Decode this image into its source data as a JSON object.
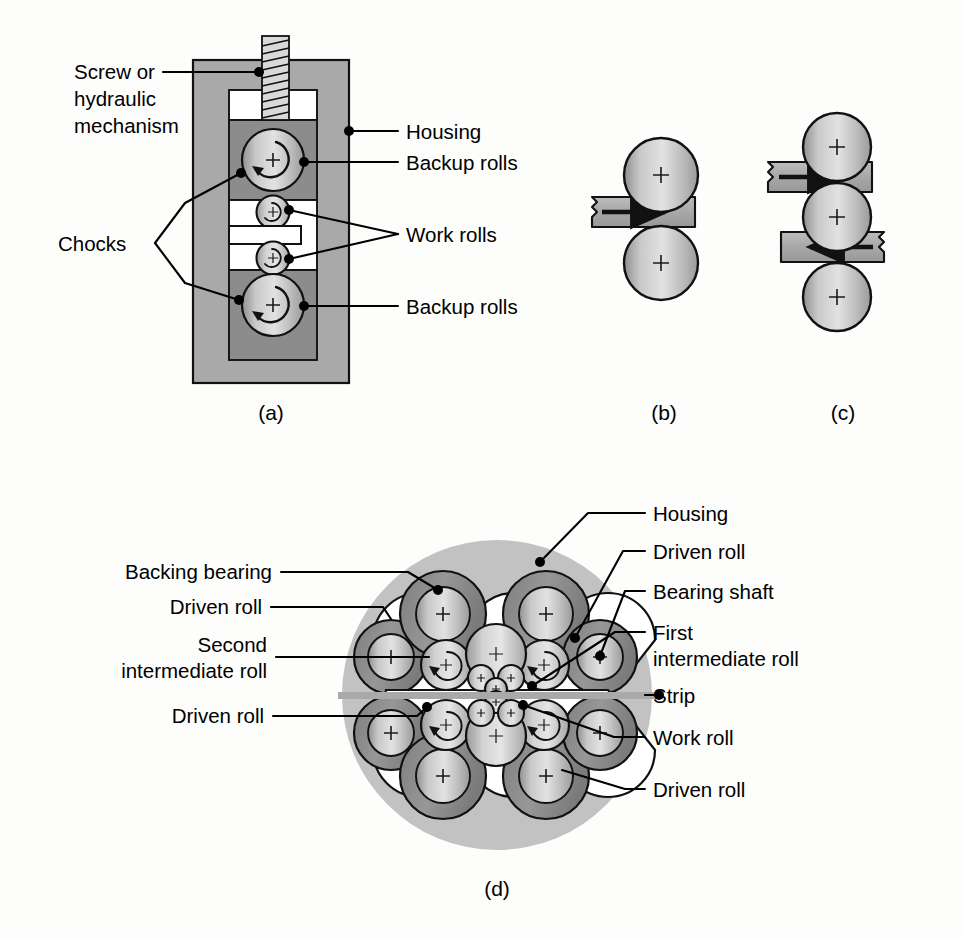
{
  "figure": {
    "background_color": "#fdfdfc",
    "line_color": "#111111",
    "text_color": "#000000",
    "housing_outer_color": "#a9a9a9",
    "housing_inner_color": "#8c8c8c",
    "roll_light_color": "#d6d6d6",
    "roll_mid_color": "#b4b4b4",
    "bearing_ring_color": "#8f8f8f",
    "strip_color": "#b0b0b0",
    "cluster_disc_color": "#c2c2c2"
  },
  "panels": [
    {
      "id": "a",
      "caption": "(a)",
      "name": "four-high-rolling-mill",
      "labels": [
        {
          "id": "screw",
          "text_lines": [
            "Screw or",
            "hydraulic",
            "mechanism"
          ],
          "side": "left"
        },
        {
          "id": "chocks",
          "text_lines": [
            "Chocks"
          ],
          "side": "left"
        },
        {
          "id": "housing",
          "text_lines": [
            "Housing"
          ],
          "side": "right"
        },
        {
          "id": "backup-rolls-top",
          "text_lines": [
            "Backup rolls"
          ],
          "side": "right"
        },
        {
          "id": "work-rolls",
          "text_lines": [
            "Work rolls"
          ],
          "side": "right"
        },
        {
          "id": "backup-rolls-bottom",
          "text_lines": [
            "Backup rolls"
          ],
          "side": "right"
        }
      ]
    },
    {
      "id": "b",
      "caption": "(b)",
      "name": "two-high-rolling-mill",
      "labels": []
    },
    {
      "id": "c",
      "caption": "(c)",
      "name": "three-high-reversing-mill",
      "labels": []
    },
    {
      "id": "d",
      "caption": "(d)",
      "name": "cluster-sendzimir-mill",
      "labels": [
        {
          "id": "backing-bearing",
          "text_lines": [
            "Backing bearing"
          ],
          "side": "left"
        },
        {
          "id": "driven-roll-upper-left",
          "text_lines": [
            "Driven roll"
          ],
          "side": "left"
        },
        {
          "id": "second-intermediate-roll",
          "text_lines": [
            "Second",
            "intermediate roll"
          ],
          "side": "left"
        },
        {
          "id": "driven-roll-lower-left",
          "text_lines": [
            "Driven roll"
          ],
          "side": "left"
        },
        {
          "id": "housing",
          "text_lines": [
            "Housing"
          ],
          "side": "right"
        },
        {
          "id": "driven-roll-upper-right",
          "text_lines": [
            "Driven roll"
          ],
          "side": "right"
        },
        {
          "id": "bearing-shaft",
          "text_lines": [
            "Bearing shaft"
          ],
          "side": "right"
        },
        {
          "id": "first-intermediate-roll",
          "text_lines": [
            "First",
            "intermediate roll"
          ],
          "side": "right"
        },
        {
          "id": "strip",
          "text_lines": [
            "Strip"
          ],
          "side": "right"
        },
        {
          "id": "work-roll",
          "text_lines": [
            "Work roll"
          ],
          "side": "right"
        },
        {
          "id": "driven-roll-lower-right",
          "text_lines": [
            "Driven roll"
          ],
          "side": "right"
        }
      ]
    }
  ],
  "text": {
    "a": {
      "screw_l1": "Screw or",
      "screw_l2": "hydraulic",
      "screw_l3": "mechanism",
      "chocks": "Chocks",
      "housing": "Housing",
      "backup_top": "Backup rolls",
      "work_rolls": "Work rolls",
      "backup_bottom": "Backup rolls",
      "caption": "(a)"
    },
    "b": {
      "caption": "(b)"
    },
    "c": {
      "caption": "(c)"
    },
    "d": {
      "backing_bearing": "Backing bearing",
      "driven_roll_ul": "Driven roll",
      "second_l1": "Second",
      "second_l2": "intermediate roll",
      "driven_roll_ll": "Driven roll",
      "housing": "Housing",
      "driven_roll_ur": "Driven roll",
      "bearing_shaft": "Bearing shaft",
      "first_l1": "First",
      "first_l2": "intermediate roll",
      "strip": "Strip",
      "work_roll": "Work roll",
      "driven_roll_lr": "Driven roll",
      "caption": "(d)"
    }
  }
}
